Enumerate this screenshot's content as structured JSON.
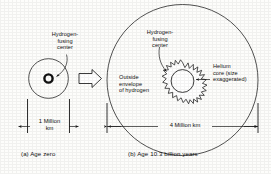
{
  "figure": {
    "panels": [
      {
        "id": "a",
        "caption": "(a) Age zero",
        "scale_label": "1 Million\nkm",
        "annotations": [
          {
            "name": "hydrogen-fusing-center",
            "text": "Hydrogen-\nfusing\ncenter"
          }
        ]
      },
      {
        "id": "b",
        "caption": "(b) Age 10.3 billion years",
        "scale_label": "4 Million km",
        "annotations": [
          {
            "name": "hydrogen-fusing-center",
            "text": "Hydrogen-\nfusing\ncenter"
          },
          {
            "name": "helium-core",
            "text": "Helium\ncore (size\nexaggerated)"
          },
          {
            "name": "outside-envelope",
            "text": "Outside\nenvelope\nof hydrogen"
          }
        ]
      }
    ],
    "transition_arrow": "evolves-to-arrow",
    "colors": {
      "ink": "#121212",
      "background": "#fdfdfb",
      "stroke": "#1a1a1a",
      "core_fill": "#ffffff"
    }
  }
}
